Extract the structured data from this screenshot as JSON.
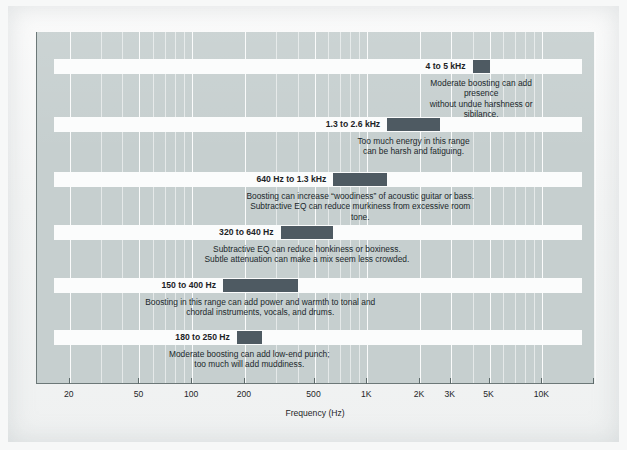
{
  "chart_data": {
    "type": "bar",
    "title": "",
    "xlabel": "Frequency (Hz)",
    "ylabel": "",
    "scale": "log",
    "xlim": [
      13,
      20000
    ],
    "grid": true,
    "legend": "none",
    "tick_labels": [
      "20",
      "50",
      "100",
      "200",
      "500",
      "1K",
      "2K",
      "3K",
      "5K",
      "10K"
    ],
    "tick_values": [
      20,
      50,
      100,
      200,
      500,
      1000,
      2000,
      3000,
      5000,
      10000
    ],
    "bands": [
      {
        "label": "4 to 5 kHz",
        "low": 4000,
        "high": 5000,
        "caption": "Moderate boosting can add presence\nwithout undue harshness or sibilance."
      },
      {
        "label": "1.3 to 2.6 kHz",
        "low": 1300,
        "high": 2600,
        "caption": "Too much energy in this range\ncan be harsh and fatiguing."
      },
      {
        "label": "640 Hz to 1.3 kHz",
        "low": 640,
        "high": 1300,
        "caption": "Boosting can increase “woodiness” of acoustic guitar or bass.\nSubtractive EQ can reduce murkiness from excessive room tone."
      },
      {
        "label": "320 to 640 Hz",
        "low": 320,
        "high": 640,
        "caption": "Subtractive EQ can reduce honkiness or boxiness.\nSubtle attenuation can make a mix seem less crowded."
      },
      {
        "label": "150 to 400 Hz",
        "low": 150,
        "high": 400,
        "caption": "Boosting in this range can add power and warmth to tonal and\nchordal instruments, vocals, and drums."
      },
      {
        "label": "180 to 250 Hz",
        "low": 180,
        "high": 250,
        "caption": "Moderate boosting can add low-end punch;\ntoo much will add muddiness."
      }
    ]
  },
  "colors": {
    "plot_background": "#c6cfcf",
    "band_block": "#4e5a62",
    "band_track": "#fbfcfc",
    "text": "#20282b",
    "axis": "#5d6a6a",
    "page": "#f4f5f5"
  }
}
